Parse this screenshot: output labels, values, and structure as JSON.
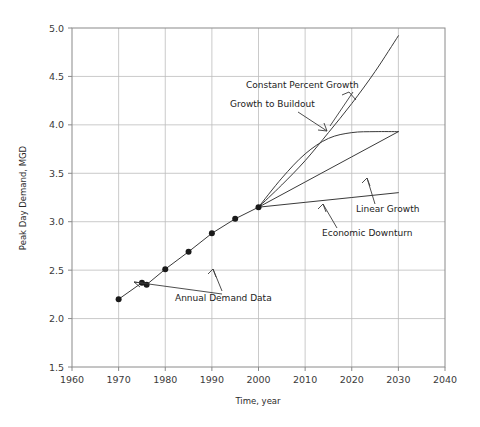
{
  "chart_data": {
    "type": "line",
    "title": "",
    "xlabel": "Time, year",
    "ylabel": "Peak Day Demand, MGD",
    "xlim": [
      1960,
      2040
    ],
    "ylim": [
      1.5,
      5.0
    ],
    "xticks": [
      1960,
      1970,
      1980,
      1990,
      2000,
      2010,
      2020,
      2030,
      2040
    ],
    "yticks": [
      "1.5",
      "2.0",
      "2.5",
      "3.0",
      "3.5",
      "4.0",
      "4.5",
      "5.0"
    ],
    "grid": true,
    "legend_position": "inline-annotations",
    "series": [
      {
        "name": "Annual Demand Data",
        "marker": "filled-circle",
        "x": [
          1970,
          1975,
          1976,
          1980,
          1985,
          1990,
          1995,
          2000
        ],
        "values": [
          2.2,
          2.37,
          2.35,
          2.51,
          2.69,
          2.88,
          3.03,
          3.15
        ]
      },
      {
        "name": "Constant Percent Growth",
        "marker": "none",
        "x": [
          2000,
          2005,
          2010,
          2015,
          2020,
          2025,
          2030
        ],
        "values": [
          3.15,
          3.38,
          3.63,
          3.92,
          4.22,
          4.55,
          4.92
        ]
      },
      {
        "name": "Growth to Buildout",
        "marker": "none",
        "x": [
          2000,
          2005,
          2010,
          2015,
          2020,
          2025,
          2030
        ],
        "values": [
          3.15,
          3.45,
          3.7,
          3.86,
          3.92,
          3.93,
          3.93
        ]
      },
      {
        "name": "Linear Growth",
        "marker": "none",
        "x": [
          2000,
          2010,
          2020,
          2030
        ],
        "values": [
          3.15,
          3.41,
          3.67,
          3.93
        ]
      },
      {
        "name": "Economic Downturn",
        "marker": "none",
        "x": [
          2000,
          2010,
          2020,
          2030
        ],
        "values": [
          3.15,
          3.2,
          3.25,
          3.3
        ]
      }
    ],
    "annotations": [
      {
        "text": "Constant Percent Growth",
        "label_x": 246,
        "label_y": 88
      },
      {
        "text": "Growth to Buildout",
        "label_x": 230,
        "label_y": 107
      },
      {
        "text": "Linear Growth",
        "label_x": 356,
        "label_y": 212
      },
      {
        "text": "Economic Downturn",
        "label_x": 322,
        "label_y": 236
      },
      {
        "text": "Annual Demand Data",
        "label_x": 175,
        "label_y": 301
      }
    ]
  },
  "axes": {
    "y_title": "Peak Day Demand, MGD",
    "x_title": "Time, year",
    "x_tick_labels": [
      "1960",
      "1970",
      "1980",
      "1990",
      "2000",
      "2010",
      "2020",
      "2030",
      "2040"
    ],
    "y_tick_labels": [
      "5.0",
      "4.5",
      "4.0",
      "3.5",
      "3.0",
      "2.5",
      "2.0",
      "1.5"
    ]
  },
  "annotations": {
    "constant_percent_growth": "Constant Percent Growth",
    "growth_to_buildout": "Growth to Buildout",
    "linear_growth": "Linear Growth",
    "economic_downturn": "Economic Downturn",
    "annual_demand_data": "Annual Demand Data"
  },
  "colors": {
    "line": "#3a3a3a",
    "grid": "#bdbdbd",
    "frame": "#8a8a8a",
    "marker": "#1a1a1a",
    "text": "#222222",
    "background": "#ffffff"
  }
}
